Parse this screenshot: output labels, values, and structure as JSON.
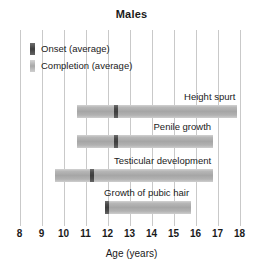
{
  "chart_data": {
    "type": "bar",
    "title": "Males",
    "xlabel": "Age (years)",
    "ylabel": "",
    "xlim": [
      8,
      18
    ],
    "xticks": [
      8,
      9,
      10,
      11,
      12,
      13,
      14,
      15,
      16,
      17,
      18
    ],
    "grid": true,
    "orientation": "horizontal",
    "legend_position": "top-left",
    "legend": [
      {
        "name": "Onset (average)",
        "color": "#4a4a4a"
      },
      {
        "name": "Completion (average)",
        "color": "#b0b0b0"
      }
    ],
    "categories": [
      "Height spurt",
      "Penile growth",
      "Testicular development",
      "Growth of pubic hair"
    ],
    "series": [
      {
        "name": "Height spurt",
        "start": 10.6,
        "end": 17.9,
        "onset_average": 12.4
      },
      {
        "name": "Penile growth",
        "start": 10.6,
        "end": 16.8,
        "onset_average": 12.4
      },
      {
        "name": "Testicular development",
        "start": 9.6,
        "end": 16.8,
        "onset_average": 11.3
      },
      {
        "name": "Growth of pubic hair",
        "start": 11.9,
        "end": 15.8,
        "onset_average": 12.0
      }
    ]
  },
  "title": "Males",
  "axis": {
    "label": "Age (years)",
    "ticks": [
      "8",
      "9",
      "10",
      "11",
      "12",
      "13",
      "14",
      "15",
      "16",
      "17",
      "18"
    ]
  },
  "legend": {
    "items": [
      {
        "label": "Onset (average)"
      },
      {
        "label": "Completion (average)"
      }
    ]
  },
  "bars": [
    {
      "label": "Height spurt"
    },
    {
      "label": "Penile growth"
    },
    {
      "label": "Testicular development"
    },
    {
      "label": "Growth of pubic hair"
    }
  ]
}
